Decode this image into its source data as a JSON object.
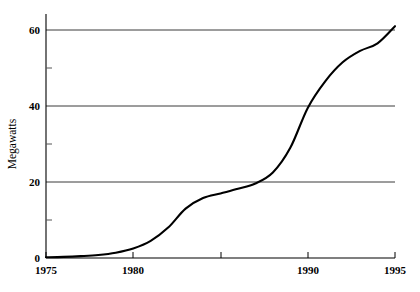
{
  "chart_data": {
    "type": "line",
    "title": "",
    "subtitle": "",
    "xlabel": "",
    "ylabel": "Megawatts",
    "xlim": [
      1975,
      1995
    ],
    "ylim": [
      0,
      60
    ],
    "grid": "horizontal-major",
    "legend": "none",
    "x_ticks": [
      1975,
      1980,
      1985,
      1990,
      1995
    ],
    "x_tick_labels": [
      "1975",
      "1980",
      "",
      "1990",
      "1995"
    ],
    "y_ticks": [
      0,
      20,
      40,
      60
    ],
    "y_tick_labels": [
      "0",
      "20",
      "40",
      "60"
    ],
    "y_minor_ticks": [
      10,
      30,
      50
    ],
    "series": [
      {
        "name": "Installed capacity",
        "color": "#000000",
        "x": [
          1975,
          1976,
          1977,
          1978,
          1979,
          1980,
          1981,
          1982,
          1983,
          1984,
          1985,
          1986,
          1987,
          1988,
          1989,
          1990,
          1991,
          1992,
          1993,
          1994,
          1995
        ],
        "values": [
          0.2,
          0.3,
          0.5,
          0.8,
          1.4,
          2.5,
          4.5,
          8.0,
          13.0,
          15.8,
          17.0,
          18.2,
          19.6,
          22.5,
          29.0,
          39.5,
          46.5,
          51.5,
          54.5,
          56.5,
          61.0
        ]
      }
    ]
  },
  "axes": {
    "y_axis_title": "Megawatts",
    "x_axis_title": ""
  },
  "colors": {
    "line": "#000000",
    "grid": "#3a3a3a",
    "axis": "#000000",
    "background": "#ffffff"
  }
}
